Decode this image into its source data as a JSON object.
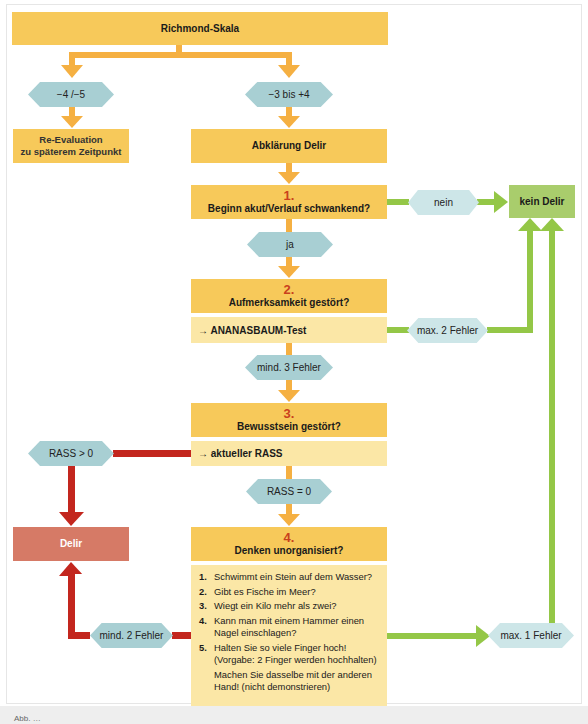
{
  "title": "Richmond-Skala",
  "colors": {
    "orange_box": "#f7c95a",
    "light_yellow_box": "#fbe7a6",
    "decision_hex": "#a8cfd3",
    "decision_hex_light": "#cde6e8",
    "green_result": "#a9cd6c",
    "red_result": "#d67a66",
    "orange_arrow": "#f5b042",
    "green_arrow": "#94c747",
    "red_arrow": "#c3261e",
    "step_number": "#c9401d"
  },
  "branches": {
    "left": {
      "condition": "−4 /−5",
      "result_line1": "Re-Evaluation",
      "result_line2": "zu späterem Zeitpunkt"
    },
    "right": {
      "condition": "−3 bis +4",
      "result": "Abklärung Delir"
    }
  },
  "steps": [
    {
      "number": "1.",
      "question": "Beginn akut/Verlauf schwankend?",
      "yes_label": "ja",
      "no_label": "nein"
    },
    {
      "number": "2.",
      "question": "Aufmerksamkeit gestört?",
      "test": "→ ANANASBAUM-Test",
      "fail_label": "mind. 3 Fehler",
      "pass_label": "max. 2 Fehler"
    },
    {
      "number": "3.",
      "question": "Bewusstsein gestört?",
      "test": "→ aktueller RASS",
      "equal_label": "RASS = 0",
      "greater_label": "RASS > 0"
    },
    {
      "number": "4.",
      "question": "Denken unorganisiert?",
      "fail_label": "mind. 2 Fehler",
      "pass_label": "max. 1 Fehler"
    }
  ],
  "questions": [
    {
      "n": "1.",
      "text": "Schwimmt ein Stein auf dem Wasser?"
    },
    {
      "n": "2.",
      "text": "Gibt es Fische im Meer?"
    },
    {
      "n": "3.",
      "text": "Wiegt ein Kilo mehr als zwei?"
    },
    {
      "n": "4.",
      "text": "Kann man mit einem Hammer einen Nagel einschlagen?"
    },
    {
      "n": "5.",
      "text": "Halten Sie so viele Finger hoch! (Vorgabe: 2 Finger werden hochhalten)"
    },
    {
      "n": "",
      "text": "Machen Sie dasselbe mit der anderen Hand! (nicht demonstrieren)"
    }
  ],
  "outcomes": {
    "no_delirium": "kein Delir",
    "delirium": "Delir"
  },
  "caption": "Abb. …"
}
